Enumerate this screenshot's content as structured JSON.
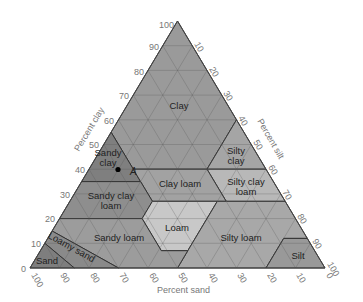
{
  "diagram": {
    "type": "soil-texture-triangle",
    "axes": {
      "clay": {
        "title": "Percent clay",
        "ticks": [
          "0",
          "10",
          "20",
          "30",
          "40",
          "50",
          "60",
          "70",
          "80",
          "90",
          "100"
        ]
      },
      "silt": {
        "title": "Percent silt",
        "ticks": [
          "10",
          "20",
          "30",
          "40",
          "50",
          "60",
          "70",
          "80",
          "90",
          "100"
        ]
      },
      "sand": {
        "title": "Percent sand",
        "ticks": [
          "100",
          "90",
          "80",
          "70",
          "60",
          "50",
          "40",
          "30",
          "20",
          "10",
          "0"
        ]
      }
    },
    "regions": [
      {
        "name": "Clay",
        "label": "Clay",
        "color": "#9a9a9a"
      },
      {
        "name": "Sandy clay",
        "label_lines": [
          "Sandy",
          "clay"
        ],
        "color": "#7f7f7f"
      },
      {
        "name": "Silty clay",
        "label_lines": [
          "Silty",
          "clay"
        ],
        "color": "#a5a5a5"
      },
      {
        "name": "Silty clay loam",
        "label_lines": [
          "Silty clay",
          "loam"
        ],
        "color": "#b8b8b8"
      },
      {
        "name": "Clay loam",
        "label": "Clay loam",
        "color": "#a2a2a2"
      },
      {
        "name": "Sandy clay loam",
        "label_lines": [
          "Sandy clay",
          "loam"
        ],
        "color": "#8e8e8e"
      },
      {
        "name": "Loam",
        "label": "Loam",
        "color": "#c8c8c8"
      },
      {
        "name": "Silty loam",
        "label": "Silty loam",
        "color": "#a8a8a8"
      },
      {
        "name": "Silt",
        "label": "Silt",
        "color": "#999999"
      },
      {
        "name": "Sandy loam",
        "label": "Sandy loam",
        "color": "#9c9c9c"
      },
      {
        "name": "Loamy sand",
        "label": "Loamy sand",
        "color": "#8a8a8a"
      },
      {
        "name": "Sand",
        "label": "Sand",
        "color": "#7e7e7e"
      }
    ],
    "point": {
      "label": "A",
      "clay": 40,
      "silt": 15,
      "sand": 45
    }
  }
}
